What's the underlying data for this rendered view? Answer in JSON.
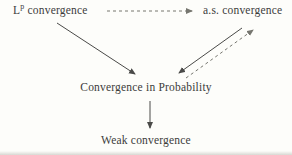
{
  "background": "#fdfdfa",
  "colors": {
    "text": "#3c3c3a",
    "solid_line": "#4a4a48",
    "dashed_line": "#76766f"
  },
  "nodes": {
    "lp": {
      "base": "L",
      "sup": "p",
      "rest": " convergence"
    },
    "as": {
      "label": "a.s. convergence"
    },
    "cip": {
      "label": "Convergence in Probability"
    },
    "weak": {
      "label": "Weak convergence"
    }
  },
  "edges": [
    {
      "from": "Lp convergence",
      "to": "a.s. convergence",
      "style": "dashed",
      "direction": "right"
    },
    {
      "from": "Lp convergence",
      "to": "Convergence in Probability",
      "style": "solid",
      "direction": "down-right"
    },
    {
      "from": "a.s. convergence",
      "to": "Convergence in Probability",
      "style": "solid",
      "direction": "down-left"
    },
    {
      "from": "Convergence in Probability",
      "to": "a.s. convergence",
      "style": "dashed",
      "direction": "up-right"
    },
    {
      "from": "Convergence in Probability",
      "to": "Weak convergence",
      "style": "solid",
      "direction": "down"
    }
  ]
}
